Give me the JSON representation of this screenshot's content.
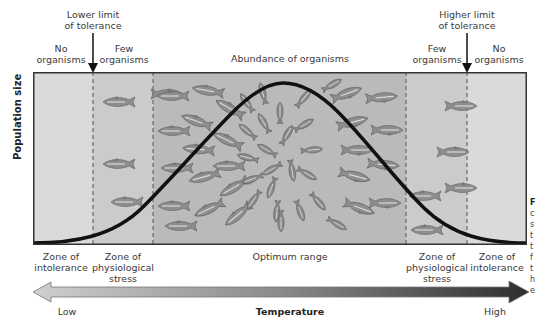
{
  "figure": {
    "y_axis_label": "Population size",
    "top_labels": {
      "lower_limit": [
        "Lower limit",
        "of tolerance"
      ],
      "higher_limit": [
        "Higher limit",
        "of tolerance"
      ],
      "left_no_organisms": [
        "No",
        "organisms"
      ],
      "left_few_organisms": [
        "Few",
        "organisms"
      ],
      "abundance": "Abundance of organisms",
      "right_few_organisms": [
        "Few",
        "organisms"
      ],
      "right_no_organisms": [
        "No",
        "organisms"
      ]
    },
    "zones": [
      {
        "name": "Zone of intolerance",
        "lines": [
          "Zone of",
          "intolerance"
        ],
        "x_start": 0,
        "x_end": 60,
        "color": "#d9d9d9"
      },
      {
        "name": "Zone of physiological stress",
        "lines": [
          "Zone of",
          "physiological",
          "stress"
        ],
        "x_start": 60,
        "x_end": 120,
        "color": "#c9c9c9"
      },
      {
        "name": "Optimum range",
        "lines": [
          "Optimum range"
        ],
        "x_start": 120,
        "x_end": 373,
        "color": "#b8b8b8"
      },
      {
        "name": "Zone of physiological stress",
        "lines": [
          "Zone of",
          "physiological",
          "stress"
        ],
        "x_start": 373,
        "x_end": 434,
        "color": "#c9c9c9"
      },
      {
        "name": "Zone of intolerance",
        "lines": [
          "Zone of",
          "intolerance"
        ],
        "x_start": 434,
        "x_end": 494,
        "color": "#d9d9d9"
      }
    ],
    "x_axis": {
      "label": "Temperature",
      "low": "Low",
      "high": "High"
    },
    "side_caption_fragment": [
      "F",
      "c",
      "s",
      "t",
      "t",
      "f",
      "t",
      "h",
      "e"
    ]
  },
  "colors": {
    "curve": "#111111",
    "arrow_light": "#c8c8c8",
    "arrow_dark": "#333333",
    "fish": "#8a8a8a",
    "border": "#333333"
  }
}
